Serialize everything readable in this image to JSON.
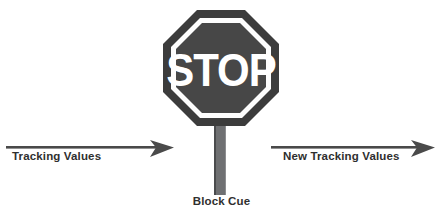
{
  "diagram": {
    "background_color": "#ffffff"
  },
  "sign": {
    "text": "STOP",
    "shape": "octagon",
    "border_color": "#3c3c3c",
    "ring_color": "#ffffff",
    "face_color": "#464646",
    "text_color": "#ffffff",
    "pole_color": "#6f7072"
  },
  "arrows": {
    "left": {
      "label": "Tracking Values",
      "direction": "right",
      "color": "#4a4a4a"
    },
    "right": {
      "label": "New Tracking Values",
      "direction": "right",
      "color": "#4a4a4a"
    }
  },
  "labels": {
    "block_cue": "Block Cue"
  }
}
